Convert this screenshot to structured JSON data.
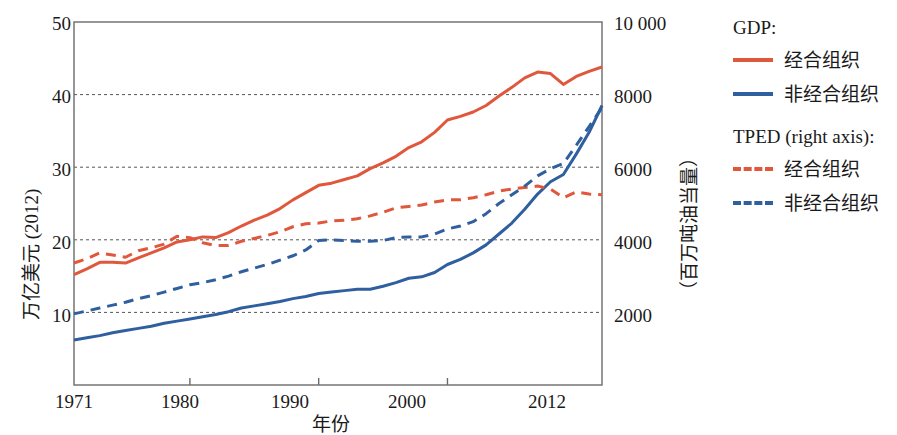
{
  "chart_data": {
    "type": "line",
    "title": "",
    "xlabel": "年份",
    "ylabel": "万亿美元 (2012)",
    "y2label": "（百万吨油当量）",
    "xlim": [
      1971,
      2012
    ],
    "ylim": [
      0,
      50
    ],
    "y2lim": [
      0,
      10000
    ],
    "grid": true,
    "legend_position": "right",
    "xticks": [
      "1971",
      "1980",
      "1990",
      "2000",
      "2012"
    ],
    "xtick_values": [
      1971,
      1980,
      1990,
      2000,
      2012
    ],
    "yticks": [
      "10",
      "20",
      "30",
      "40",
      "50"
    ],
    "ytick_values": [
      10,
      20,
      30,
      40,
      50
    ],
    "y2ticks": [
      "2000",
      "4000",
      "6000",
      "8000",
      "10 000"
    ],
    "y2tick_values": [
      2000,
      4000,
      6000,
      8000,
      10000
    ],
    "legend_groups": [
      {
        "title": "GDP:",
        "entries": [
          {
            "label": "经合组织",
            "color": "#e0573c",
            "style": "solid"
          },
          {
            "label": "非经合组织",
            "color": "#2f5f9e",
            "style": "solid"
          }
        ]
      },
      {
        "title": "TPED (right axis):",
        "entries": [
          {
            "label": "经合组织",
            "color": "#e0573c",
            "style": "dashed"
          },
          {
            "label": "非经合组织",
            "color": "#2f5f9e",
            "style": "dashed"
          }
        ]
      }
    ],
    "x": [
      1971,
      1972,
      1973,
      1974,
      1975,
      1976,
      1977,
      1978,
      1979,
      1980,
      1981,
      1982,
      1983,
      1984,
      1985,
      1986,
      1987,
      1988,
      1989,
      1990,
      1991,
      1992,
      1993,
      1994,
      1995,
      1996,
      1997,
      1998,
      1999,
      2000,
      2001,
      2002,
      2003,
      2004,
      2005,
      2006,
      2007,
      2008,
      2009,
      2010,
      2011,
      2012
    ],
    "series": [
      {
        "name": "GDP 经合组织",
        "axis": "left",
        "color": "#e0573c",
        "style": "solid",
        "unit": "万亿美元 (2012)",
        "values": [
          15.2,
          16.0,
          16.9,
          16.9,
          16.8,
          17.5,
          18.2,
          18.9,
          19.7,
          20.0,
          20.4,
          20.3,
          21.0,
          21.9,
          22.7,
          23.4,
          24.3,
          25.5,
          26.5,
          27.5,
          27.8,
          28.3,
          28.8,
          29.8,
          30.6,
          31.5,
          32.7,
          33.5,
          34.8,
          36.5,
          37.0,
          37.6,
          38.5,
          39.8,
          41.0,
          42.3,
          43.1,
          42.9,
          41.4,
          42.5,
          43.2,
          43.8
        ]
      },
      {
        "name": "GDP 非经合组织",
        "axis": "left",
        "color": "#2f5f9e",
        "style": "solid",
        "unit": "万亿美元 (2012)",
        "values": [
          6.2,
          6.5,
          6.8,
          7.2,
          7.5,
          7.8,
          8.1,
          8.5,
          8.8,
          9.1,
          9.4,
          9.7,
          10.1,
          10.6,
          10.9,
          11.2,
          11.5,
          11.9,
          12.2,
          12.6,
          12.8,
          13.0,
          13.2,
          13.2,
          13.6,
          14.1,
          14.7,
          14.9,
          15.5,
          16.6,
          17.3,
          18.2,
          19.3,
          20.8,
          22.3,
          24.2,
          26.3,
          28.0,
          29.0,
          31.8,
          34.8,
          38.5
        ]
      },
      {
        "name": "TPED 经合组织",
        "axis": "right",
        "color": "#e0573c",
        "style": "dashed",
        "unit": "百万吨油当量",
        "left_equiv": [
          16.8,
          17.4,
          18.2,
          17.9,
          17.6,
          18.5,
          18.9,
          19.4,
          20.5,
          20.3,
          19.6,
          19.2,
          19.2,
          19.8,
          20.2,
          20.6,
          21.1,
          21.8,
          22.2,
          22.3,
          22.6,
          22.7,
          22.9,
          23.3,
          23.8,
          24.4,
          24.6,
          24.8,
          25.2,
          25.5,
          25.5,
          25.8,
          26.2,
          26.7,
          27.0,
          27.2,
          27.4,
          27.0,
          25.8,
          26.6,
          26.3,
          26.2
        ],
        "values": [
          3360,
          3480,
          3640,
          3580,
          3520,
          3700,
          3780,
          3880,
          4100,
          4060,
          3920,
          3840,
          3840,
          3960,
          4040,
          4120,
          4220,
          4360,
          4440,
          4460,
          4520,
          4540,
          4580,
          4660,
          4760,
          4880,
          4920,
          4960,
          5040,
          5100,
          5100,
          5160,
          5240,
          5340,
          5400,
          5440,
          5480,
          5400,
          5160,
          5320,
          5260,
          5240
        ]
      },
      {
        "name": "TPED 非经合组织",
        "axis": "right",
        "color": "#2f5f9e",
        "style": "dashed",
        "unit": "百万吨油当量",
        "left_equiv": [
          9.8,
          10.2,
          10.6,
          11.0,
          11.4,
          11.9,
          12.3,
          12.8,
          13.3,
          13.8,
          14.1,
          14.5,
          15.0,
          15.6,
          16.1,
          16.6,
          17.2,
          17.8,
          18.6,
          19.9,
          20.0,
          19.9,
          19.8,
          19.8,
          19.9,
          20.3,
          20.4,
          20.4,
          20.8,
          21.5,
          21.9,
          22.5,
          23.6,
          25.0,
          26.2,
          27.4,
          28.8,
          29.8,
          30.5,
          33.0,
          35.6,
          38.2
        ],
        "values": [
          1960,
          2040,
          2120,
          2200,
          2280,
          2380,
          2460,
          2560,
          2660,
          2760,
          2820,
          2900,
          3000,
          3120,
          3220,
          3320,
          3440,
          3560,
          3720,
          3980,
          4000,
          3980,
          3960,
          3960,
          3980,
          4060,
          4080,
          4080,
          4160,
          4300,
          4380,
          4500,
          4720,
          5000,
          5240,
          5480,
          5760,
          5960,
          6100,
          6600,
          7120,
          7640
        ]
      }
    ]
  }
}
